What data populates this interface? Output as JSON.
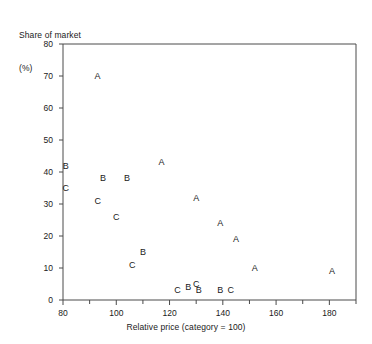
{
  "chart_data": {
    "type": "scatter",
    "title": "",
    "ylabel": "Share of market\n(%)",
    "ylabel_line1": "Share of market",
    "ylabel_line2": "(%)",
    "xlabel": "Relative price (category = 100)",
    "xlim": [
      80,
      190
    ],
    "ylim": [
      0,
      80
    ],
    "xticks": [
      80,
      100,
      120,
      140,
      160,
      180
    ],
    "xticks_minor": [
      90,
      110,
      130,
      150,
      170,
      190
    ],
    "yticks": [
      0,
      10,
      20,
      30,
      40,
      50,
      60,
      70,
      80
    ],
    "grid": false,
    "legend": "none",
    "marker_style": "letter",
    "series": [
      {
        "name": "A",
        "marker": "A",
        "points": [
          {
            "x": 93,
            "y": 70
          },
          {
            "x": 117,
            "y": 43
          },
          {
            "x": 130,
            "y": 32
          },
          {
            "x": 139,
            "y": 24
          },
          {
            "x": 145,
            "y": 19
          },
          {
            "x": 152,
            "y": 10
          },
          {
            "x": 181,
            "y": 9
          }
        ]
      },
      {
        "name": "B",
        "marker": "B",
        "points": [
          {
            "x": 81,
            "y": 42
          },
          {
            "x": 95,
            "y": 38
          },
          {
            "x": 104,
            "y": 38
          },
          {
            "x": 110,
            "y": 15
          },
          {
            "x": 127,
            "y": 4
          },
          {
            "x": 131,
            "y": 3
          },
          {
            "x": 139,
            "y": 3
          }
        ]
      },
      {
        "name": "C",
        "marker": "C",
        "points": [
          {
            "x": 81,
            "y": 35
          },
          {
            "x": 93,
            "y": 31
          },
          {
            "x": 100,
            "y": 26
          },
          {
            "x": 106,
            "y": 11
          },
          {
            "x": 123,
            "y": 3
          },
          {
            "x": 130,
            "y": 5
          },
          {
            "x": 143,
            "y": 3
          }
        ]
      }
    ]
  },
  "axis_colors": {
    "line": "#4a4a4a",
    "text": "#1a1a1a"
  }
}
